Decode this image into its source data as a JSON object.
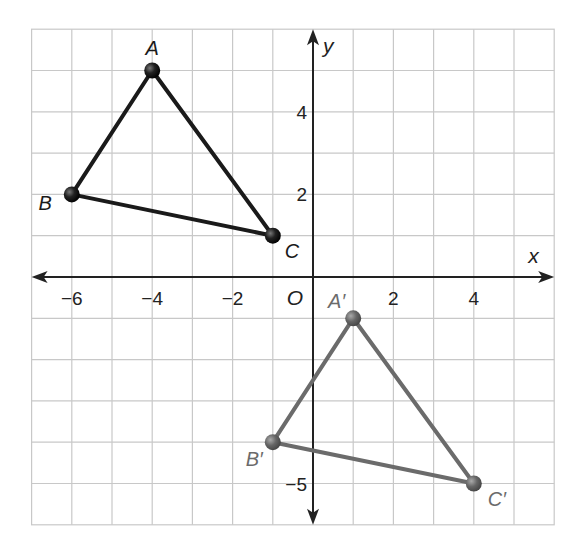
{
  "chart_data": {
    "type": "scatter",
    "title": "",
    "xlabel": "x",
    "ylabel": "y",
    "xlim": [
      -7,
      6
    ],
    "ylim": [
      -6,
      6
    ],
    "grid": true,
    "x_ticks": [
      {
        "value": -6,
        "label": "−6"
      },
      {
        "value": -4,
        "label": "−4"
      },
      {
        "value": -2,
        "label": "−2"
      },
      {
        "value": 2,
        "label": "2"
      },
      {
        "value": 4,
        "label": "4"
      }
    ],
    "y_ticks": [
      {
        "value": 4,
        "label": "4"
      },
      {
        "value": 2,
        "label": "2"
      },
      {
        "value": -5,
        "label": "−5"
      }
    ],
    "origin_label": "O",
    "series": [
      {
        "name": "Triangle ABC",
        "kind": "polygon",
        "color": "#1a1a1a",
        "points": [
          {
            "label": "A",
            "x": -4,
            "y": 5
          },
          {
            "label": "B",
            "x": -6,
            "y": 2
          },
          {
            "label": "C",
            "x": -1,
            "y": 1
          }
        ]
      },
      {
        "name": "Triangle A'B'C'",
        "kind": "polygon",
        "color": "#6b6b6b",
        "points": [
          {
            "label": "A′",
            "x": 1,
            "y": -1
          },
          {
            "label": "B′",
            "x": -1,
            "y": -4
          },
          {
            "label": "C′",
            "x": 4,
            "y": -5
          }
        ]
      }
    ]
  },
  "colors": {
    "grid": "#c8c8c8",
    "axis": "#222222",
    "original": "#1a1a1a",
    "image": "#6b6b6b",
    "background": "#ffffff"
  }
}
